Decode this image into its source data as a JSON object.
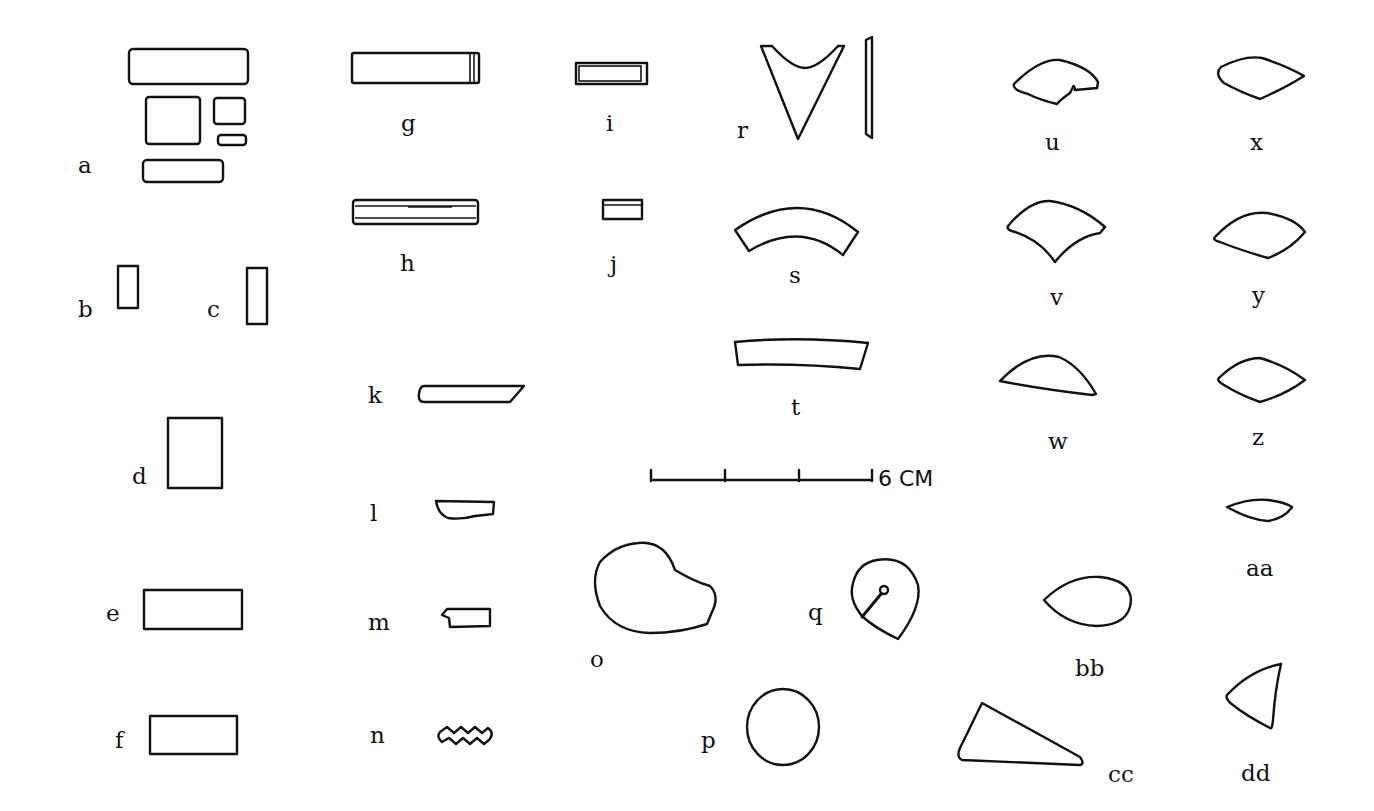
{
  "figure": {
    "stroke_color": "#111111",
    "background": "#ffffff",
    "labels": {
      "a": "a",
      "b": "b",
      "c": "c",
      "d": "d",
      "e": "e",
      "f": "f",
      "g": "g",
      "h": "h",
      "i": "i",
      "j": "j",
      "k": "k",
      "l": "l",
      "m": "m",
      "n": "n",
      "o": "o",
      "p": "p",
      "q": "q",
      "r": "r",
      "s": "s",
      "t": "t",
      "u": "u",
      "v": "v",
      "w": "w",
      "x": "x",
      "y": "y",
      "z": "z",
      "aa": "aa",
      "bb": "bb",
      "cc": "cc",
      "dd": "dd"
    },
    "scale_bar": {
      "label": "6 CM",
      "value": 6,
      "unit": "CM",
      "divisions": 3
    }
  }
}
